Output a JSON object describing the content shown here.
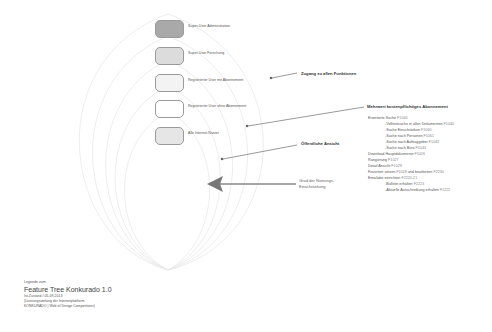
{
  "roles": [
    {
      "label": "Super-User Administration",
      "fill": "#a9a9a9"
    },
    {
      "label": "Super-User Forschung",
      "fill": "#dcdcdc"
    },
    {
      "label": "Registrierter User mit Abonnement",
      "fill": "#f3f3f3"
    },
    {
      "label": "Registrierter User ohne Abonnement",
      "fill": "#ffffff"
    },
    {
      "label": "Alle Internet-Nutzer",
      "fill": "#e6e6e6"
    }
  ],
  "callouts": {
    "all_functions": "Zugang zu allen Funktionen",
    "paid_subscription": "Mehrwert kostenpflichtiges Abonnement",
    "public_view": "Öffentliche Ansicht"
  },
  "features": [
    {
      "label": "Erweiterte Suche",
      "code": "F1040",
      "level": 0
    },
    {
      "label": "-Volltextsuche in allen Dokumenten",
      "code": "F1040",
      "level": 1
    },
    {
      "label": "-Suche Einschränken",
      "code": "F1060",
      "level": 1
    },
    {
      "label": "-Suche nach Personen",
      "code": "F1061",
      "level": 1
    },
    {
      "label": "-Suche nach Auftraggeber",
      "code": "F1042",
      "level": 1
    },
    {
      "label": "-Suche nach Büro",
      "code": "F1043",
      "level": 1
    },
    {
      "label": "Download Hauptdokumente",
      "code": "F1026",
      "level": 0
    },
    {
      "label": "Rangierung",
      "code": "F1027",
      "level": 0
    },
    {
      "label": "Detail Ansicht",
      "code": "F1029",
      "level": 0
    },
    {
      "label": "Favoriten setzen",
      "code": "F1028",
      "label2": " und bearbeiten",
      "code2": "F2230",
      "level": 0
    },
    {
      "label": "Emailabo einrichten",
      "code": "F2220-21",
      "level": 0
    },
    {
      "label": "-Bulletin erhalten",
      "code": "F2223",
      "level": 1
    },
    {
      "label": "-Aktuelle Ausschreibung erhalten",
      "code": "F2222",
      "level": 1
    }
  ],
  "axis": {
    "label_line1": "Grad der Nutzungs-",
    "label_line2": "Einschränkung"
  },
  "legend": {
    "pre": "Legende zum",
    "title": "Feature Tree Konkurado 1.0",
    "line1": "Ist-Zustand / 05-09-2013",
    "line2": "(Leistungsumfang der Internetplattform",
    "line3": "KONKURADO | Web of Design Competitions)"
  },
  "colors": {
    "arc_stroke": "#e8e8e8",
    "arrow": "#777777",
    "box_border": "#9a9a9a"
  }
}
